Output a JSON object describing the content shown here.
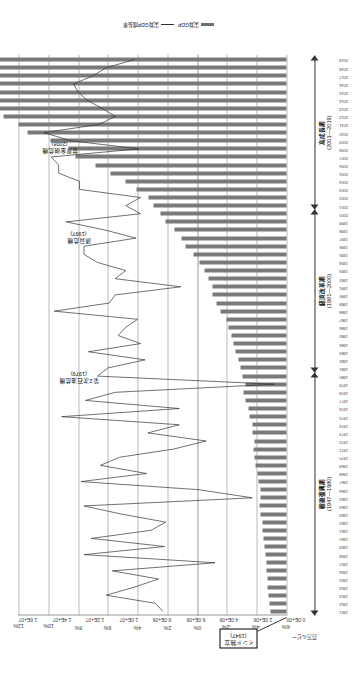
{
  "chart_data": {
    "type": "bar",
    "title": "",
    "xlabel": "",
    "ylabel": "百万ルピー",
    "value_axis": {
      "label": "百万ルピー",
      "ticks": [
        "0.0E+00",
        "2.0E+06",
        "4.0E+06",
        "6.0E+06",
        "8.0E+06",
        "1.0E+07",
        "1.2E+07",
        "1.4E+07",
        "1.6E+07"
      ],
      "min": 0,
      "max": 16000000
    },
    "secondary_axis": {
      "label": "",
      "ticks": [
        "-6%",
        "-4%",
        "-2%",
        "0%",
        "2%",
        "4%",
        "6%",
        "8%",
        "10%",
        "12%"
      ],
      "min": -6,
      "max": 12
    },
    "legend": [
      {
        "name": "実質GDP",
        "type": "bar"
      },
      {
        "name": "実質GDP成長率",
        "type": "line"
      }
    ],
    "grid": true,
    "categories": [
      "1951",
      "1952",
      "1953",
      "1954",
      "1955",
      "1956",
      "1957",
      "1958",
      "1959",
      "1960",
      "1961",
      "1962",
      "1963",
      "1964",
      "1965",
      "1966",
      "1967",
      "1968",
      "1969",
      "1970",
      "1971",
      "1972",
      "1973",
      "1974",
      "1975",
      "1976",
      "1977",
      "1978",
      "1979",
      "1980",
      "1981",
      "1982",
      "1983",
      "1984",
      "1985",
      "1986",
      "1987",
      "1988",
      "1989",
      "1990",
      "1991",
      "1992",
      "1993",
      "1994",
      "1995",
      "1996",
      "1997",
      "1998",
      "1999",
      "2000",
      "2001",
      "2002",
      "2003",
      "2004",
      "2005",
      "2006",
      "2007",
      "2008",
      "2009",
      "2010",
      "2011",
      "2012",
      "2013",
      "2014",
      "2015",
      "2016",
      "2017",
      "2018",
      "2019"
    ],
    "series": [
      {
        "name": "実質GDP",
        "type": "bar",
        "unit": "百万ルピー",
        "values": [
          980000,
          1000000,
          1060000,
          1110000,
          1140000,
          1200000,
          1180000,
          1270000,
          1300000,
          1390000,
          1430000,
          1460000,
          1530000,
          1640000,
          1570000,
          1560000,
          1680000,
          1730000,
          1840000,
          1930000,
          1950000,
          1940000,
          2030000,
          2050000,
          2230000,
          2260000,
          2430000,
          2560000,
          2430000,
          2600000,
          2760000,
          2850000,
          3060000,
          3180000,
          3310000,
          3450000,
          3580000,
          3940000,
          4180000,
          4400000,
          4420000,
          4660000,
          4890000,
          5200000,
          5580000,
          6020000,
          6270000,
          6670000,
          7240000,
          7530000,
          7940000,
          8260000,
          8930000,
          9610000,
          10500000,
          11410000,
          12570000,
          13010000,
          14070000,
          15440000,
          16000000,
          16870000,
          17970000,
          19300000,
          20650000,
          22300000,
          23900000,
          25300000,
          26400000
        ]
      },
      {
        "name": "実質GDP成長率",
        "type": "line",
        "unit": "%",
        "values": [
          2.3,
          2.8,
          6.1,
          4.2,
          2.6,
          5.7,
          -1.2,
          7.6,
          2.2,
          7.1,
          3.1,
          2.1,
          5.1,
          7.6,
          -3.7,
          -0.1,
          7.8,
          3.4,
          6.5,
          5.2,
          1.6,
          -0.6,
          3.3,
          1.2,
          9.1,
          1.2,
          7.5,
          5.5,
          -5.2,
          6.7,
          6.0,
          3.5,
          7.3,
          3.8,
          5.3,
          4.8,
          4.0,
          9.6,
          5.9,
          5.5,
          1.1,
          5.5,
          4.8,
          6.7,
          7.6,
          7.6,
          4.1,
          6.2,
          8.8,
          3.8,
          4.8,
          3.8,
          7.9,
          7.9,
          9.3,
          9.3,
          9.8,
          3.9,
          8.5,
          10.3,
          6.6,
          5.5,
          6.4,
          7.4,
          8.0,
          8.3,
          7.0,
          6.1,
          4.2
        ]
      }
    ],
    "annotations": [
      {
        "id": "second-oil-crisis",
        "title": "第2次石油危機",
        "year": "(1979)"
      },
      {
        "id": "currency-crisis",
        "title": "通貨危機",
        "year": "(1997)"
      },
      {
        "id": "global-financial-crisis",
        "title": "世界金融危機",
        "year": "(2008)"
      },
      {
        "id": "india-independence",
        "title": "インド独立",
        "year": "(1947)",
        "boxed": true
      }
    ],
    "eras": [
      {
        "id": "postwar",
        "name": "戦後復興期",
        "range": "(1947—1980)"
      },
      {
        "id": "reform",
        "name": "経済改革期",
        "range": "(1981—2000)"
      },
      {
        "id": "growth",
        "name": "高成長期",
        "range": "(2001—2019)"
      }
    ],
    "colors": {
      "bar": "#7a7a7a",
      "line": "#333333",
      "grid": "#b9b9b9",
      "axis": "#9a9a9a"
    }
  }
}
